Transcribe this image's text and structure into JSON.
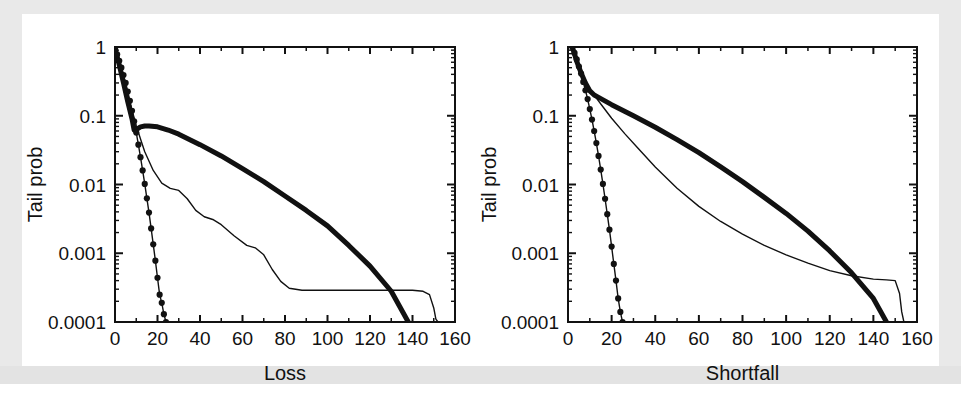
{
  "figure": {
    "background_color": "#ffffff",
    "border_color": "#e9e9e9",
    "ink_color": "#111111"
  },
  "chart_data": [
    {
      "type": "line",
      "panel": "left",
      "title": "",
      "xlabel": "Loss",
      "ylabel": "Tail prob",
      "xlim": [
        0,
        160
      ],
      "ylim": [
        0.0001,
        1
      ],
      "yscale": "log",
      "xscale": "linear",
      "grid": false,
      "legend": "none",
      "xticks": [
        0,
        20,
        40,
        60,
        80,
        100,
        120,
        140,
        160
      ],
      "xticklabels": [
        "0",
        "20",
        "40",
        "60",
        "80",
        "100",
        "120",
        "140",
        "160"
      ],
      "yticks": [
        1,
        0.1,
        0.01,
        0.001,
        0.0001
      ],
      "yticklabels": [
        "1",
        "0.1",
        "0.01",
        "0.001",
        "0.0001"
      ],
      "series": [
        {
          "name": "thick-line",
          "style": "thick solid",
          "linewidth": 5,
          "marker": "none",
          "x": [
            0,
            2,
            4,
            6,
            8,
            9,
            10,
            12,
            14,
            16,
            20,
            25,
            30,
            40,
            50,
            60,
            70,
            80,
            90,
            100,
            110,
            120,
            130,
            138
          ],
          "y": [
            0.95,
            0.55,
            0.3,
            0.16,
            0.09,
            0.062,
            0.063,
            0.069,
            0.071,
            0.071,
            0.069,
            0.062,
            0.054,
            0.038,
            0.026,
            0.017,
            0.011,
            0.0068,
            0.0042,
            0.0025,
            0.0013,
            0.00065,
            0.00028,
            0.0001
          ]
        },
        {
          "name": "thin-staircase-line",
          "style": "thin solid",
          "linewidth": 1.4,
          "marker": "none",
          "x": [
            0,
            2,
            4,
            6,
            8,
            10,
            12,
            14,
            18,
            22,
            26,
            30,
            34,
            38,
            42,
            46,
            50,
            56,
            62,
            66,
            70,
            74,
            78,
            82,
            88,
            100,
            120,
            140,
            145,
            148,
            150,
            151,
            152
          ],
          "y": [
            1.0,
            0.62,
            0.36,
            0.2,
            0.12,
            0.072,
            0.046,
            0.03,
            0.016,
            0.0105,
            0.0088,
            0.0082,
            0.0062,
            0.0042,
            0.0034,
            0.0031,
            0.0026,
            0.0018,
            0.0013,
            0.0012,
            0.00095,
            0.00058,
            0.00039,
            0.00031,
            0.00029,
            0.00029,
            0.00029,
            0.00029,
            0.00028,
            0.00025,
            0.00016,
            0.00011,
            0.0001
          ]
        },
        {
          "name": "dotted-marker-line",
          "style": "thin solid with round markers",
          "linewidth": 1.4,
          "marker": "circle",
          "x": [
            0,
            1,
            2,
            3,
            4,
            5,
            6,
            7,
            8,
            9,
            10,
            11,
            12,
            13,
            14,
            15,
            16,
            17,
            18,
            19,
            20,
            21,
            22,
            23,
            24
          ],
          "y": [
            0.95,
            0.78,
            0.63,
            0.5,
            0.39,
            0.3,
            0.225,
            0.165,
            0.118,
            0.083,
            0.057,
            0.038,
            0.025,
            0.016,
            0.0102,
            0.0063,
            0.0039,
            0.0023,
            0.00135,
            0.00078,
            0.00044,
            0.00025,
            0.00019,
            0.00013,
            0.0001
          ]
        }
      ]
    },
    {
      "type": "line",
      "panel": "right",
      "title": "",
      "xlabel": "Shortfall",
      "ylabel": "Tail prob",
      "xlim": [
        0,
        160
      ],
      "ylim": [
        0.0001,
        1
      ],
      "yscale": "log",
      "xscale": "linear",
      "grid": false,
      "legend": "none",
      "xticks": [
        0,
        20,
        40,
        60,
        80,
        100,
        120,
        140,
        160
      ],
      "xticklabels": [
        "0",
        "20",
        "40",
        "60",
        "80",
        "100",
        "120",
        "140",
        "160"
      ],
      "yticks": [
        1,
        0.1,
        0.01,
        0.001,
        0.0001
      ],
      "yticklabels": [
        "1",
        "0.1",
        "0.01",
        "0.001",
        "0.0001"
      ],
      "series": [
        {
          "name": "thick-line",
          "style": "thick solid",
          "linewidth": 5,
          "marker": "none",
          "x": [
            2,
            4,
            6,
            8,
            10,
            12,
            14,
            20,
            30,
            40,
            50,
            60,
            70,
            80,
            90,
            100,
            110,
            120,
            130,
            140,
            146
          ],
          "y": [
            1.0,
            0.62,
            0.42,
            0.3,
            0.23,
            0.2,
            0.185,
            0.145,
            0.1,
            0.068,
            0.045,
            0.029,
            0.018,
            0.011,
            0.0065,
            0.0038,
            0.0021,
            0.00108,
            0.00052,
            0.00022,
            0.0001
          ]
        },
        {
          "name": "thin-curve-line",
          "style": "thin solid",
          "linewidth": 1.4,
          "marker": "none",
          "x": [
            2,
            4,
            6,
            8,
            10,
            12,
            16,
            20,
            26,
            32,
            40,
            50,
            60,
            70,
            80,
            90,
            100,
            110,
            120,
            130,
            140,
            146,
            150,
            152,
            153,
            154
          ],
          "y": [
            1.0,
            0.62,
            0.42,
            0.3,
            0.23,
            0.2,
            0.135,
            0.092,
            0.055,
            0.034,
            0.018,
            0.0088,
            0.0048,
            0.0029,
            0.0019,
            0.0013,
            0.00095,
            0.00072,
            0.00056,
            0.00047,
            0.00042,
            0.00041,
            0.0004,
            0.00026,
            0.00014,
            0.0001
          ]
        },
        {
          "name": "dotted-marker-line",
          "style": "thin solid with round markers",
          "linewidth": 1.4,
          "marker": "circle",
          "x": [
            2,
            3,
            4,
            5,
            6,
            7,
            8,
            9,
            10,
            11,
            12,
            13,
            14,
            15,
            16,
            17,
            18,
            19,
            20,
            21,
            22,
            23,
            24,
            25
          ],
          "y": [
            1.0,
            0.82,
            0.66,
            0.52,
            0.41,
            0.31,
            0.235,
            0.175,
            0.125,
            0.088,
            0.06,
            0.04,
            0.026,
            0.0165,
            0.0102,
            0.0062,
            0.0037,
            0.0022,
            0.00125,
            0.0007,
            0.0004,
            0.00022,
            0.00014,
            0.0001
          ]
        }
      ]
    }
  ]
}
